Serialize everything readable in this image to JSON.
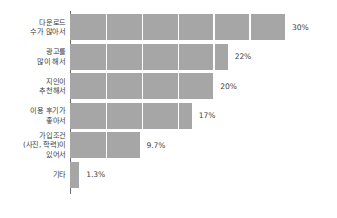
{
  "chart_data": {
    "type": "bar",
    "orientation": "horizontal",
    "title": "",
    "subtitle": "",
    "xlabel": "",
    "ylabel": "",
    "xlim": [
      0,
      30
    ],
    "grid": true,
    "grid_axis": "x",
    "grid_interval": 5,
    "legend": false,
    "legend_position": "none",
    "bar_color": "#a6a6a6",
    "axis_color": "#6e6e6e",
    "gridline_color": "#ffffff",
    "label_color": "#3c3c3c",
    "categories": [
      "다운로드\n수가 많아서",
      "광고를\n많이 해서",
      "지인이\n추천해서",
      "이용 후기가\n좋아서",
      "가입조건\n(사진, 학력)이\n있어서",
      "기타"
    ],
    "values": [
      30,
      22,
      20,
      17,
      9.7,
      1.3
    ],
    "value_labels": [
      "30%",
      "22%",
      "20%",
      "17%",
      "9.7%",
      "1.3%"
    ]
  }
}
